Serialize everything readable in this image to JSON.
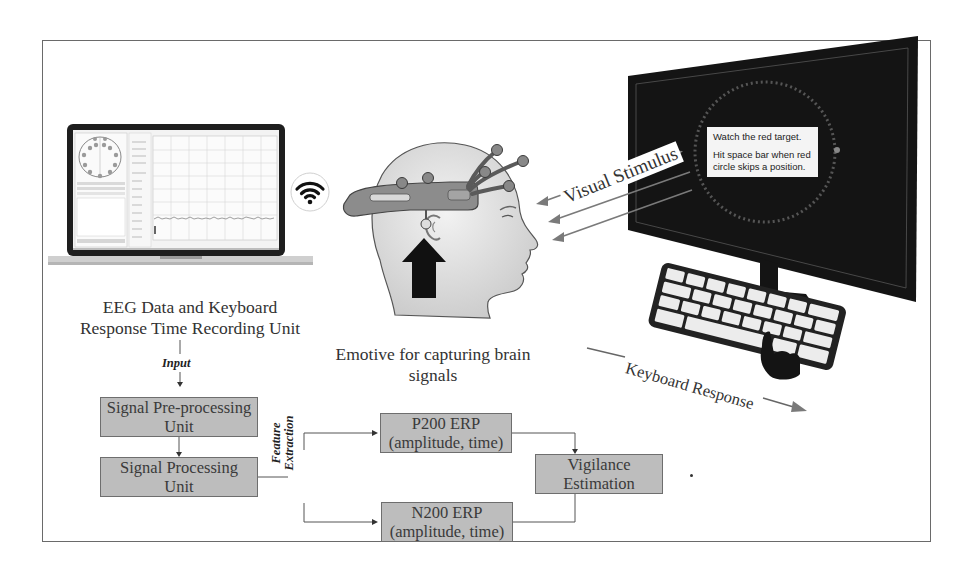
{
  "diagram": {
    "recording_unit": {
      "caption_line1": "EEG Data and Keyboard",
      "caption_line2": "Response Time Recording Unit",
      "connection_icon": "wifi-icon"
    },
    "headset": {
      "caption_line1": "Emotive for capturing brain",
      "caption_line2": "signals"
    },
    "display": {
      "message_line1": "Watch the red target.",
      "message_line2": "Hit space bar when red",
      "message_line3": "circle skips a position.",
      "stimulus_label": "Visual Stimulus",
      "keyboard_label": "Keyboard Response"
    },
    "flow": {
      "input_label": "Input",
      "feature_label_line1": "Feature",
      "feature_label_line2": "Extraction",
      "boxes": {
        "preprocessing_line1": "Signal Pre-processing",
        "preprocessing_line2": "Unit",
        "processing_line1": "Signal Processing",
        "processing_line2": "Unit",
        "p200_line1": "P200 ERP",
        "p200_line2": "(amplitude, time)",
        "n200_line1": "N200 ERP",
        "n200_line2": "(amplitude, time)",
        "vigilance_line1": "Vigilance",
        "vigilance_line2": "Estimation"
      }
    },
    "colors": {
      "box_fill": "#bdbdbd",
      "box_border": "#6e6e6e",
      "monitor": "#141414",
      "arrow_gray": "#7a7a7a"
    }
  }
}
